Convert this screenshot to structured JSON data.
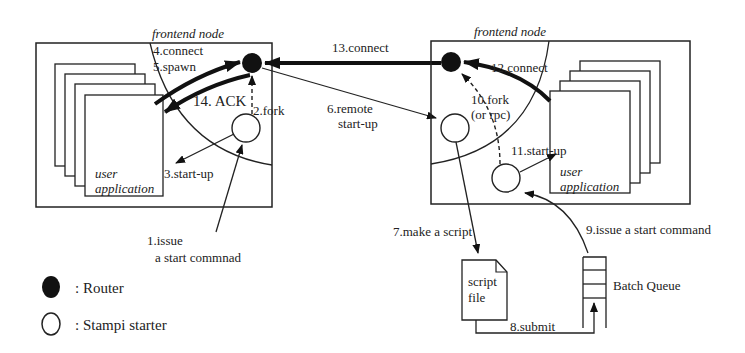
{
  "diagram": {
    "left_node": {
      "label": "frontend node",
      "app_label_line1": "user",
      "app_label_line2": "application"
    },
    "right_node": {
      "label": "frontend node",
      "app_label_line1": "user",
      "app_label_line2": "application"
    },
    "steps": {
      "s1_line1": "1.issue",
      "s1_line2": "a start commnad",
      "s2": "2.fork",
      "s3": "3.start-up",
      "s4": "4.connect",
      "s5": "5.spawn",
      "s6_line1": "6.remote",
      "s6_line2": "start-up",
      "s7": "7.make a script",
      "s8": "8.submit",
      "s9": "9.issue a start command",
      "s10_line1": "10.fork",
      "s10_line2": "(or rpc)",
      "s11": "11.start-up",
      "s12": "12.connect",
      "s13": "13.connect",
      "s14": "14. ACK"
    },
    "script_file": {
      "line1": "script",
      "line2": "file"
    },
    "batch_queue": {
      "label": "Batch Queue"
    },
    "legend": [
      {
        "symbol": "filled-circle",
        "label": ": Router"
      },
      {
        "symbol": "open-circle",
        "label": ": Stampi starter"
      }
    ]
  }
}
